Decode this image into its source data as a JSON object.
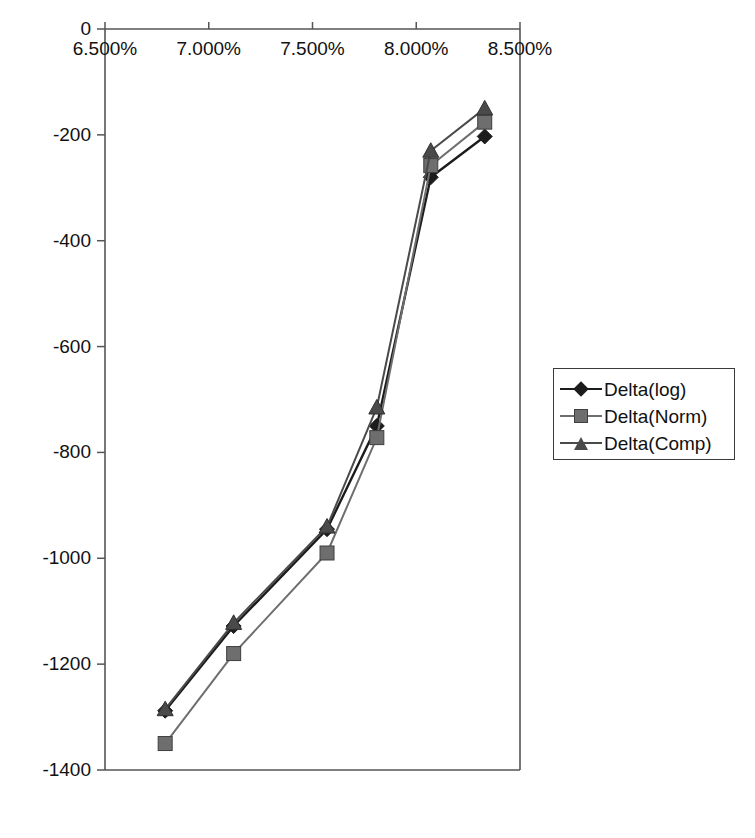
{
  "chart_data": {
    "type": "line",
    "title": "",
    "xlabel": "",
    "ylabel": "",
    "x": [
      6.79,
      7.12,
      7.57,
      7.81,
      8.07,
      8.33
    ],
    "x_tick_labels": [
      "6.500%",
      "7.000%",
      "7.500%",
      "8.000%",
      "8.500%"
    ],
    "x_tick_values": [
      6.5,
      7.0,
      7.5,
      8.0,
      8.5
    ],
    "xlim": [
      6.5,
      8.5
    ],
    "y_tick_labels": [
      "0",
      "-200",
      "-400",
      "-600",
      "-800",
      "-1000",
      "-1200",
      "-1400"
    ],
    "y_tick_values": [
      0,
      -200,
      -400,
      -600,
      -800,
      -1000,
      -1200,
      -1400
    ],
    "ylim": [
      -1400,
      0
    ],
    "grid": false,
    "legend_position": "right",
    "x_axis_position": "top",
    "series": [
      {
        "name": "Delta(log)",
        "marker": "diamond",
        "color": "#1c1c1c",
        "values": [
          -1288,
          -1128,
          -945,
          -750,
          -280,
          -203
        ]
      },
      {
        "name": "Delta(Norm)",
        "marker": "square",
        "color": "#6e6e6e",
        "values": [
          -1350,
          -1180,
          -990,
          -772,
          -258,
          -176
        ]
      },
      {
        "name": "Delta(Comp)",
        "marker": "triangle",
        "color": "#4a4a4a",
        "values": [
          -1285,
          -1122,
          -940,
          -715,
          -230,
          -150
        ]
      }
    ]
  },
  "axis": {
    "line_color": "#555555",
    "tick_color": "#555555"
  },
  "legend": {
    "items": [
      {
        "label": "Delta(log)"
      },
      {
        "label": "Delta(Norm)"
      },
      {
        "label": "Delta(Comp)"
      }
    ]
  }
}
